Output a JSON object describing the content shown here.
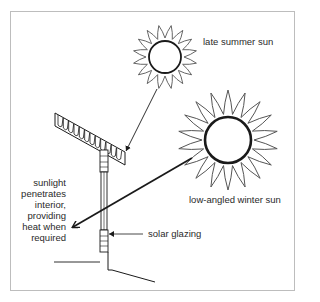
{
  "diagram": {
    "labels": {
      "summer_sun": "late summer sun",
      "winter_sun": "low-angled winter sun",
      "solar_glazing": "solar glazing",
      "sunlight_lines": [
        "sunlight",
        "penetrates",
        "interior,",
        "providing",
        "heat when",
        "required"
      ]
    },
    "elements": {
      "summer_sun": {
        "cx": 165,
        "cy": 57,
        "r": 16,
        "ray_r": 32,
        "rays": 16
      },
      "winter_sun": {
        "cx": 228,
        "cy": 140,
        "r": 23,
        "ray_r": 50,
        "rays": 18
      },
      "summer_arrow": {
        "from": [
          157,
          89
        ],
        "to": [
          126,
          152
        ],
        "note": "blocked by roof overhang"
      },
      "winter_arrow": {
        "from": [
          192,
          158
        ],
        "to": [
          72,
          228
        ],
        "note": "passes through glazing into interior"
      }
    },
    "colors": {
      "line": "#1a1a1a",
      "frame": "#bdbdbd",
      "text": "#2a2a2a"
    }
  }
}
